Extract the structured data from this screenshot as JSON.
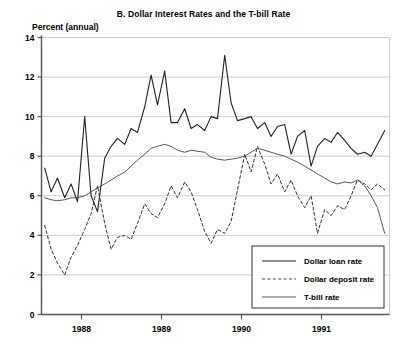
{
  "chart_data": {
    "type": "line",
    "title": "B. Dollar Interest Rates and the T-bill Rate",
    "ylabel": "Percent (annual)",
    "xlabel": "",
    "ylim": [
      0,
      14
    ],
    "yticks": [
      0,
      2,
      4,
      6,
      8,
      10,
      12,
      14
    ],
    "ytick_labels": [
      "0",
      "2",
      "4",
      "6",
      "8",
      "10",
      "12",
      "14"
    ],
    "xlim": [
      1987.5,
      1991.85
    ],
    "xticks": [
      1988,
      1989,
      1990,
      1991
    ],
    "xtick_labels": [
      "1988",
      "1989",
      "1990",
      "1991"
    ],
    "grid": "horizontal",
    "legend_position": "bottom-right",
    "colors": {
      "axis": "#555555",
      "grid": "#cccccc",
      "loan": "#222222",
      "deposit": "#333333",
      "tbill": "#444444",
      "background": "#ffffff"
    },
    "series": [
      {
        "name": "Dollar loan rate",
        "style": "solid",
        "width": 1.1,
        "x": [
          1987.54,
          1987.62,
          1987.7,
          1987.79,
          1987.87,
          1987.95,
          1988.04,
          1988.12,
          1988.2,
          1988.29,
          1988.37,
          1988.45,
          1988.54,
          1988.62,
          1988.7,
          1988.79,
          1988.87,
          1988.95,
          1989.04,
          1989.12,
          1989.2,
          1989.29,
          1989.37,
          1989.45,
          1989.54,
          1989.62,
          1989.7,
          1989.79,
          1989.87,
          1989.95,
          1990.04,
          1990.12,
          1990.2,
          1990.29,
          1990.37,
          1990.45,
          1990.54,
          1990.62,
          1990.7,
          1990.79,
          1990.87,
          1990.95,
          1991.04,
          1991.12,
          1991.2,
          1991.29,
          1991.37,
          1991.45,
          1991.54,
          1991.62,
          1991.7,
          1991.79
        ],
        "y": [
          7.4,
          6.2,
          6.9,
          5.9,
          6.6,
          5.7,
          10.0,
          6.0,
          5.2,
          7.9,
          8.5,
          8.9,
          8.6,
          9.4,
          9.2,
          10.5,
          12.1,
          10.6,
          12.3,
          9.7,
          9.7,
          10.4,
          9.4,
          9.6,
          9.3,
          10.0,
          9.9,
          13.1,
          10.7,
          9.8,
          9.9,
          10.0,
          9.4,
          9.7,
          9.0,
          9.5,
          9.6,
          8.1,
          9.0,
          9.3,
          7.5,
          8.5,
          8.9,
          8.7,
          9.2,
          8.8,
          8.4,
          8.1,
          8.2,
          8.0,
          8.6,
          9.3
        ]
      },
      {
        "name": "Dollar deposit rate",
        "style": "dashed",
        "width": 1.0,
        "x": [
          1987.54,
          1987.62,
          1987.7,
          1987.79,
          1987.87,
          1987.95,
          1988.04,
          1988.12,
          1988.2,
          1988.29,
          1988.37,
          1988.45,
          1988.54,
          1988.62,
          1988.7,
          1988.79,
          1988.87,
          1988.95,
          1989.04,
          1989.12,
          1989.2,
          1989.29,
          1989.37,
          1989.45,
          1989.54,
          1989.62,
          1989.7,
          1989.79,
          1989.87,
          1989.95,
          1990.04,
          1990.12,
          1990.2,
          1990.29,
          1990.37,
          1990.45,
          1990.54,
          1990.62,
          1990.7,
          1990.79,
          1990.87,
          1990.95,
          1991.04,
          1991.12,
          1991.2,
          1991.29,
          1991.37,
          1991.45,
          1991.54,
          1991.62,
          1991.7,
          1991.79
        ],
        "y": [
          4.5,
          3.3,
          2.6,
          2.0,
          2.9,
          3.5,
          4.3,
          5.1,
          6.5,
          4.6,
          3.3,
          3.9,
          4.0,
          3.8,
          4.6,
          5.6,
          5.1,
          4.9,
          5.6,
          6.5,
          5.9,
          6.7,
          6.2,
          5.3,
          4.2,
          3.6,
          4.3,
          4.1,
          4.7,
          6.3,
          8.1,
          7.2,
          8.5,
          7.6,
          6.6,
          7.1,
          6.2,
          6.8,
          6.0,
          5.4,
          6.0,
          4.1,
          5.3,
          5.0,
          5.5,
          5.3,
          6.0,
          6.8,
          6.6,
          6.3,
          6.6,
          6.3
        ]
      },
      {
        "name": "T-bill rate",
        "style": "solid",
        "width": 0.9,
        "x": [
          1987.54,
          1987.62,
          1987.7,
          1987.79,
          1987.87,
          1987.95,
          1988.04,
          1988.12,
          1988.2,
          1988.29,
          1988.37,
          1988.45,
          1988.54,
          1988.62,
          1988.7,
          1988.79,
          1988.87,
          1988.95,
          1989.04,
          1989.12,
          1989.2,
          1989.29,
          1989.37,
          1989.45,
          1989.54,
          1989.62,
          1989.7,
          1989.79,
          1989.87,
          1989.95,
          1990.04,
          1990.12,
          1990.2,
          1990.29,
          1990.37,
          1990.45,
          1990.54,
          1990.62,
          1990.7,
          1990.79,
          1990.87,
          1990.95,
          1991.04,
          1991.12,
          1991.2,
          1991.29,
          1991.37,
          1991.45,
          1991.54,
          1991.62,
          1991.7,
          1991.79
        ],
        "y": [
          5.9,
          5.8,
          5.75,
          5.8,
          5.9,
          5.9,
          6.0,
          6.2,
          6.4,
          6.6,
          6.8,
          7.0,
          7.2,
          7.5,
          7.8,
          8.1,
          8.4,
          8.5,
          8.6,
          8.5,
          8.3,
          8.2,
          8.3,
          8.25,
          8.2,
          7.95,
          7.85,
          7.8,
          7.85,
          7.9,
          8.0,
          8.2,
          8.4,
          8.3,
          8.2,
          8.1,
          8.0,
          7.85,
          7.7,
          7.5,
          7.3,
          7.1,
          6.9,
          6.7,
          6.6,
          6.7,
          6.65,
          6.8,
          6.5,
          6.0,
          5.4,
          4.1
        ]
      }
    ]
  },
  "legend": {
    "items": [
      {
        "label": "Dollar loan rate",
        "style": "solid"
      },
      {
        "label": "Dollar deposit rate",
        "style": "dashed"
      },
      {
        "label": "T-bill rate",
        "style": "solid-thin"
      }
    ]
  }
}
